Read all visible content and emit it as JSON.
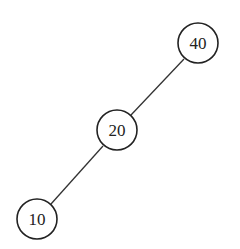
{
  "diagram": {
    "type": "binary-tree",
    "nodes": [
      {
        "id": "n40",
        "label": "40",
        "cx": 198,
        "cy": 43,
        "r": 20
      },
      {
        "id": "n20",
        "label": "20",
        "cx": 117,
        "cy": 130,
        "r": 20
      },
      {
        "id": "n10",
        "label": "10",
        "cx": 37,
        "cy": 219,
        "r": 20
      }
    ],
    "edges": [
      {
        "from": "40",
        "to": "20",
        "x1": 184,
        "y1": 59,
        "x2": 131,
        "y2": 115
      },
      {
        "from": "20",
        "to": "10",
        "x1": 103,
        "y1": 146,
        "x2": 51,
        "y2": 204
      }
    ]
  }
}
